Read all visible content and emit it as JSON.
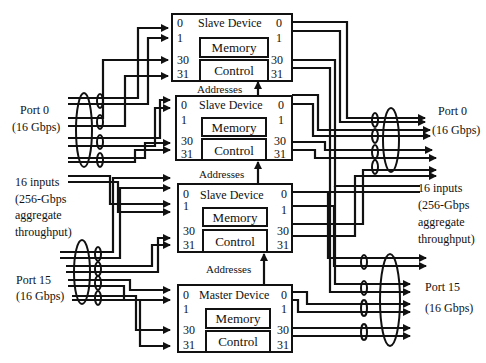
{
  "diagram": {
    "left_port_top": {
      "name": "Port 0",
      "rate": "(16 Gbps)"
    },
    "left_port_bottom": {
      "name": "Port 15",
      "rate": "(16 Gbps)"
    },
    "left_summary": [
      "16 inputs",
      "(256-Gbps",
      "aggregate",
      "throughput)"
    ],
    "right_port_top": {
      "name": "Port 0",
      "rate": "(16 Gbps)"
    },
    "right_port_bottom": {
      "name": "Port 15",
      "rate": "(16 Gbps)"
    },
    "right_summary": [
      "16 inputs",
      "(256-Gbps",
      "aggregate",
      "throughput)"
    ],
    "devices": [
      {
        "title": "Slave Device",
        "memory": "Memory",
        "control": "Control",
        "ports_in": [
          "0",
          "1",
          "30",
          "31"
        ],
        "ports_out": [
          "0",
          "1",
          "30",
          "31"
        ]
      },
      {
        "title": "Slave Device",
        "memory": "Memory",
        "control": "Control",
        "ports_in": [
          "0",
          "1",
          "30",
          "31"
        ],
        "ports_out": [
          "0",
          "1",
          "30",
          "31"
        ]
      },
      {
        "title": "Slave Device",
        "memory": "Memory",
        "control": "Control",
        "ports_in": [
          "0",
          "1",
          "30",
          "31"
        ],
        "ports_out": [
          "0",
          "1",
          "30",
          "31"
        ]
      },
      {
        "title": "Master Device",
        "memory": "Memory",
        "control": "Control",
        "ports_in": [
          "0",
          "1",
          "30",
          "31"
        ],
        "ports_out": [
          "0",
          "1",
          "30",
          "31"
        ]
      }
    ],
    "address_labels": [
      "Addresses",
      "Addresses",
      "Addresses"
    ]
  }
}
